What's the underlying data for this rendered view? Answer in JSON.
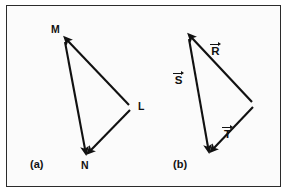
{
  "figure": {
    "background_color": "#fbfbfb",
    "border_color": "#2b2b2b",
    "stroke_color": "#111111"
  },
  "panels": [
    {
      "id": "a",
      "caption": "(a)",
      "caption_x": 30,
      "caption_y": 159,
      "vertices": [
        {
          "name": "M",
          "label": "M",
          "x": 64,
          "y": 39,
          "label_x": 51,
          "label_y": 24
        },
        {
          "name": "L",
          "label": "L",
          "x": 130,
          "y": 107,
          "label_x": 138,
          "label_y": 102
        },
        {
          "name": "N",
          "label": "N",
          "x": 86,
          "y": 152,
          "label_x": 82,
          "label_y": 160
        }
      ],
      "arrows": [
        {
          "name": "m-to-n",
          "from": "M",
          "to": "N",
          "x1": 65,
          "y1": 42,
          "x2": 85,
          "y2": 150
        },
        {
          "name": "l-to-m",
          "from": "L",
          "to": "M",
          "x1": 129,
          "y1": 105,
          "x2": 67,
          "y2": 40
        },
        {
          "name": "l-to-n",
          "from": "L",
          "to": "N",
          "x1": 130,
          "y1": 110,
          "x2": 90,
          "y2": 151
        }
      ]
    },
    {
      "id": "b",
      "caption": "(b)",
      "caption_x": 173,
      "caption_y": 159,
      "vertices": [
        {
          "name": "apex",
          "label": "",
          "x": 188,
          "y": 36
        },
        {
          "name": "right",
          "label": "",
          "x": 253,
          "y": 104
        },
        {
          "name": "bottom",
          "label": "",
          "x": 209,
          "y": 150
        }
      ],
      "arrows": [
        {
          "name": "s-vector",
          "from": "apex",
          "to": "bottom",
          "x1": 189,
          "y1": 39,
          "x2": 208,
          "y2": 148
        },
        {
          "name": "r-vector",
          "from": "right",
          "to": "apex",
          "x1": 252,
          "y1": 102,
          "x2": 191,
          "y2": 37
        },
        {
          "name": "t-vector",
          "from": "right",
          "to": "bottom",
          "x1": 253,
          "y1": 107,
          "x2": 213,
          "y2": 149
        }
      ],
      "vector_labels": [
        {
          "name": "R",
          "symbol": "R",
          "x": 213,
          "y": 45,
          "accent": "right-arrow"
        },
        {
          "name": "S",
          "symbol": "S",
          "x": 176,
          "y": 74,
          "accent": "right-arrow"
        },
        {
          "name": "T",
          "symbol": "T",
          "x": 225,
          "y": 128,
          "accent": "right-arrow"
        }
      ]
    }
  ]
}
